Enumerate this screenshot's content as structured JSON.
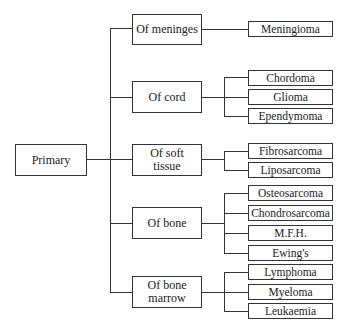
{
  "diagram": {
    "type": "tree",
    "root": {
      "label": "Primary"
    },
    "categories": [
      {
        "label": "Of meninges",
        "children": [
          "Meningioma"
        ]
      },
      {
        "label": "Of cord",
        "children": [
          "Chordoma",
          "Glioma",
          "Ependymoma"
        ]
      },
      {
        "label": "Of soft tissue",
        "label_lines": [
          "Of soft",
          "tissue"
        ],
        "children": [
          "Fibrosarcoma",
          "Liposarcoma"
        ]
      },
      {
        "label": "Of bone",
        "children": [
          "Osteosarcoma",
          "Chondrosarcoma",
          "M.F.H.",
          "Ewing's"
        ]
      },
      {
        "label": "Of bone marrow",
        "label_lines": [
          "Of bone",
          "marrow"
        ],
        "children": [
          "Lymphoma",
          "Myeloma",
          "Leukaemia"
        ]
      }
    ]
  },
  "colors": {
    "line": "#333333",
    "box_border": "#333333",
    "background": "#ffffff",
    "text": "#1a1a1a"
  }
}
